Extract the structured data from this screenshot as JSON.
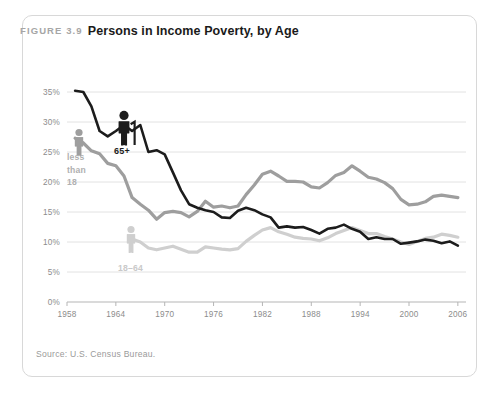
{
  "figure": {
    "number": "FIGURE 3.9",
    "title": "Persons in Income Poverty, by Age",
    "source": "Source: U.S. Census Bureau."
  },
  "labels": {
    "under18": "less\nthan\n18",
    "under18_l1": "less",
    "under18_l2": "than",
    "under18_l3": "18",
    "age65": "65+",
    "age1864": "18–64"
  },
  "colors": {
    "series_under18": "#9e9e9e",
    "series_18_64": "#cfcfcf",
    "series_65plus": "#1c1c1c",
    "grid": "#e2e2e2",
    "axis": "#b5b5b5",
    "card_border": "#d8d8d8",
    "title": "#1a1a1a",
    "fignum": "#a6a6a6"
  },
  "chart_data": {
    "type": "line",
    "title": "Persons in Income Poverty, by Age",
    "xlabel": "",
    "ylabel": "",
    "xlim": [
      1958,
      2007
    ],
    "ylim": [
      0,
      35
    ],
    "grid": true,
    "legend": "inline-labels",
    "ytick_labels": [
      "0%",
      "5%",
      "10%",
      "15%",
      "20%",
      "25%",
      "30%",
      "35%"
    ],
    "ytick_values": [
      0,
      5,
      10,
      15,
      20,
      25,
      30,
      35
    ],
    "xtick_labels": [
      "1958",
      "1964",
      "1970",
      "1976",
      "1982",
      "1988",
      "1994",
      "2000",
      "2006"
    ],
    "xtick_values": [
      1958,
      1964,
      1970,
      1976,
      1982,
      1988,
      1994,
      2000,
      2006
    ],
    "series": [
      {
        "name": "less than 18",
        "color": "#9e9e9e",
        "x": [
          1959,
          1960,
          1961,
          1962,
          1963,
          1964,
          1965,
          1966,
          1967,
          1968,
          1969,
          1970,
          1971,
          1972,
          1973,
          1974,
          1975,
          1976,
          1977,
          1978,
          1979,
          1980,
          1981,
          1982,
          1983,
          1984,
          1985,
          1986,
          1987,
          1988,
          1989,
          1990,
          1991,
          1992,
          1993,
          1994,
          1995,
          1996,
          1997,
          1998,
          1999,
          2000,
          2001,
          2002,
          2003,
          2004,
          2005,
          2006
        ],
        "values": [
          27.3,
          26.5,
          25.2,
          24.7,
          23.1,
          22.7,
          21.0,
          17.4,
          16.3,
          15.3,
          13.8,
          14.9,
          15.1,
          14.9,
          14.2,
          15.1,
          16.8,
          15.8,
          16.0,
          15.7,
          16.0,
          17.9,
          19.5,
          21.3,
          21.8,
          21.0,
          20.1,
          20.1,
          20.0,
          19.2,
          19.0,
          19.9,
          21.1,
          21.6,
          22.7,
          21.8,
          20.8,
          20.5,
          19.9,
          18.9,
          17.1,
          16.2,
          16.3,
          16.7,
          17.6,
          17.8,
          17.6,
          17.4
        ]
      },
      {
        "name": "18–64",
        "color": "#cfcfcf",
        "x": [
          1966,
          1967,
          1968,
          1969,
          1970,
          1971,
          1972,
          1973,
          1974,
          1975,
          1976,
          1977,
          1978,
          1979,
          1980,
          1981,
          1982,
          1983,
          1984,
          1985,
          1986,
          1987,
          1988,
          1989,
          1990,
          1991,
          1992,
          1993,
          1994,
          1995,
          1996,
          1997,
          1998,
          1999,
          2000,
          2001,
          2002,
          2003,
          2004,
          2005,
          2006
        ],
        "values": [
          10.5,
          10.0,
          9.0,
          8.7,
          9.0,
          9.3,
          8.8,
          8.3,
          8.3,
          9.2,
          9.0,
          8.8,
          8.7,
          8.9,
          10.1,
          11.1,
          12.0,
          12.4,
          11.7,
          11.3,
          10.8,
          10.6,
          10.5,
          10.2,
          10.7,
          11.4,
          11.9,
          12.4,
          11.9,
          11.4,
          11.4,
          10.9,
          10.5,
          10.0,
          9.6,
          10.1,
          10.6,
          10.8,
          11.3,
          11.1,
          10.8
        ]
      },
      {
        "name": "65+",
        "color": "#1c1c1c",
        "x": [
          1959,
          1960,
          1961,
          1962,
          1963,
          1964,
          1965,
          1966,
          1967,
          1968,
          1969,
          1970,
          1971,
          1972,
          1973,
          1974,
          1975,
          1976,
          1977,
          1978,
          1979,
          1980,
          1981,
          1982,
          1983,
          1984,
          1985,
          1986,
          1987,
          1988,
          1989,
          1990,
          1991,
          1992,
          1993,
          1994,
          1995,
          1996,
          1997,
          1998,
          1999,
          2000,
          2001,
          2002,
          2003,
          2004,
          2005,
          2006
        ],
        "values": [
          35.2,
          35.0,
          32.6,
          28.5,
          27.6,
          28.5,
          29.5,
          28.5,
          29.5,
          25.0,
          25.3,
          24.6,
          21.6,
          18.6,
          16.3,
          15.7,
          15.3,
          15.0,
          14.1,
          14.0,
          15.2,
          15.7,
          15.3,
          14.6,
          14.1,
          12.4,
          12.6,
          12.4,
          12.5,
          12.0,
          11.4,
          12.2,
          12.4,
          12.9,
          12.2,
          11.7,
          10.5,
          10.8,
          10.5,
          10.5,
          9.7,
          9.9,
          10.1,
          10.4,
          10.2,
          9.8,
          10.1,
          9.4
        ]
      }
    ],
    "annotations": [
      {
        "text": "less than 18",
        "series": "less than 18",
        "x": 1960,
        "icon": "person-gray"
      },
      {
        "text": "65+",
        "series": "65+",
        "x": 1964,
        "icon": "person-dark-cane"
      },
      {
        "text": "18–64",
        "series": "18–64",
        "x": 1966,
        "icon": "person-light"
      }
    ]
  }
}
